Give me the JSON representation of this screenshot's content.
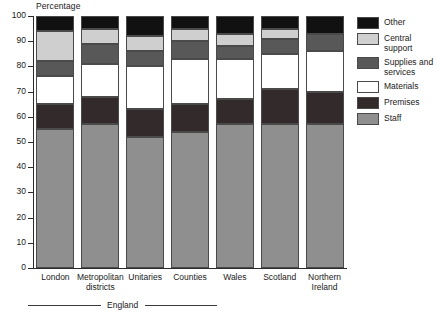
{
  "chart_data": {
    "type": "bar",
    "stacked": true,
    "title": "",
    "ylabel": "Percentage",
    "xlabel": "",
    "ylim": [
      0,
      100
    ],
    "yticks": [
      0,
      10,
      20,
      30,
      40,
      50,
      60,
      70,
      80,
      90,
      100
    ],
    "grid": false,
    "legend_position": "right",
    "categories": [
      "London",
      "Metropolitan districts",
      "Unitaries",
      "Counties",
      "Wales",
      "Scotland",
      "Northern Ireland"
    ],
    "category_lines": [
      [
        "London"
      ],
      [
        "Metropolitan",
        "districts"
      ],
      [
        "Unitaries"
      ],
      [
        "Counties"
      ],
      [
        "Wales"
      ],
      [
        "Scotland"
      ],
      [
        "Northern",
        "Ireland"
      ]
    ],
    "group_bracket": {
      "label": "England",
      "spans": [
        "London",
        "Metropolitan districts",
        "Unitaries",
        "Counties"
      ]
    },
    "series": [
      {
        "name": "Staff",
        "color": "#8f8f8f",
        "values": [
          55,
          57,
          52,
          54,
          57,
          57,
          57
        ]
      },
      {
        "name": "Premises",
        "color": "#332b2b",
        "values": [
          10,
          11,
          11,
          11,
          10,
          14,
          13
        ]
      },
      {
        "name": "Materials",
        "color": "#ffffff",
        "values": [
          11,
          13,
          17,
          18,
          16,
          14,
          16
        ]
      },
      {
        "name": "Supplies and services",
        "color": "#585858",
        "values": [
          6,
          8,
          6,
          7,
          5,
          6,
          7
        ]
      },
      {
        "name": "Central support",
        "color": "#cfcfcf",
        "values": [
          12,
          6,
          6,
          5,
          5,
          4,
          0
        ]
      },
      {
        "name": "Other",
        "color": "#111111",
        "values": [
          6,
          5,
          8,
          5,
          7,
          5,
          7
        ]
      }
    ],
    "legend_entries": [
      {
        "name": "Other",
        "color": "#111111"
      },
      {
        "name": "Central support",
        "color": "#cfcfcf"
      },
      {
        "name": "Supplies and services",
        "color": "#585858"
      },
      {
        "name": "Materials",
        "color": "#ffffff"
      },
      {
        "name": "Premises",
        "color": "#332b2b"
      },
      {
        "name": "Staff",
        "color": "#8f8f8f"
      }
    ],
    "legend_label_lines": [
      [
        "Other"
      ],
      [
        "Central",
        "support"
      ],
      [
        "Supplies and",
        "services"
      ],
      [
        "Materials"
      ],
      [
        "Premises"
      ],
      [
        "Staff"
      ]
    ]
  }
}
